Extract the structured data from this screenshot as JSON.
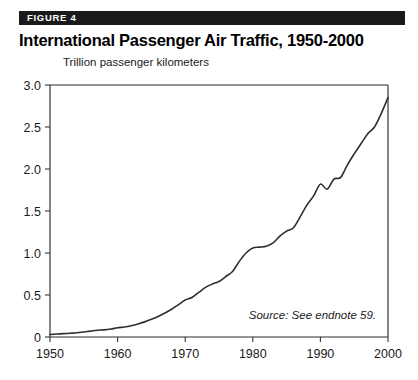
{
  "figure": {
    "banner_label": "FIGURE 4",
    "title": "International Passenger Air Traffic, 1950-2000",
    "banner_color": "#1a1a1a",
    "line_color": "#2e2e2e"
  },
  "chart_data": {
    "type": "line",
    "title": "International Passenger Air Traffic, 1950-2000",
    "subtitle": "",
    "xlabel": "",
    "ylabel": "Trillion passenger kilometers",
    "axis_note": "Trillion passenger kilometers",
    "source_note": "Source: See endnote 59.",
    "xlim": [
      1950,
      2000
    ],
    "ylim": [
      0,
      3.0
    ],
    "grid": false,
    "legend": false,
    "legend_position": "none",
    "xticks": [
      1950,
      1960,
      1970,
      1980,
      1990,
      2000
    ],
    "xtick_labels": [
      "1950",
      "1960",
      "1970",
      "1980",
      "1990",
      "2000"
    ],
    "yticks": [
      0,
      0.5,
      1.0,
      1.5,
      2.0,
      2.5,
      3.0
    ],
    "ytick_labels": [
      "0",
      "0.5",
      "1.0",
      "1.5",
      "2.0",
      "2.5",
      "3.0"
    ],
    "series": [
      {
        "name": "International passenger air traffic",
        "x": [
          1950,
          1951,
          1952,
          1953,
          1954,
          1955,
          1956,
          1957,
          1958,
          1959,
          1960,
          1961,
          1962,
          1963,
          1964,
          1965,
          1966,
          1967,
          1968,
          1969,
          1970,
          1971,
          1972,
          1973,
          1974,
          1975,
          1976,
          1977,
          1978,
          1979,
          1980,
          1981,
          1982,
          1983,
          1984,
          1985,
          1986,
          1987,
          1988,
          1989,
          1990,
          1991,
          1992,
          1993,
          1994,
          1995,
          1996,
          1997,
          1998,
          1999,
          2000
        ],
        "values": [
          0.03,
          0.035,
          0.04,
          0.045,
          0.05,
          0.06,
          0.07,
          0.08,
          0.085,
          0.095,
          0.11,
          0.12,
          0.135,
          0.155,
          0.18,
          0.21,
          0.245,
          0.285,
          0.33,
          0.385,
          0.44,
          0.47,
          0.53,
          0.59,
          0.63,
          0.66,
          0.72,
          0.78,
          0.9,
          1.0,
          1.06,
          1.07,
          1.08,
          1.12,
          1.2,
          1.26,
          1.3,
          1.43,
          1.57,
          1.68,
          1.82,
          1.76,
          1.88,
          1.9,
          2.05,
          2.18,
          2.3,
          2.42,
          2.5,
          2.66,
          2.85
        ]
      }
    ]
  }
}
